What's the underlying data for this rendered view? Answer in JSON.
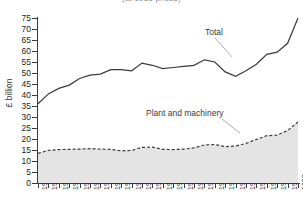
{
  "chart": {
    "title": "(at 1985 prices)",
    "y_axis_title": "£ billion",
    "total_label": "Total",
    "plant_label": "Plant and machinery"
  },
  "chart_data": {
    "type": "area",
    "title": "(at 1985 prices)",
    "xlabel": "",
    "ylabel": "£ billion",
    "ylim": [
      0,
      75
    ],
    "ytick_step": 5,
    "yticks": [
      0,
      5,
      10,
      15,
      20,
      25,
      30,
      35,
      40,
      45,
      50,
      55,
      60,
      65,
      70,
      75
    ],
    "grid": false,
    "legend": "inline-annotations",
    "categories": [
      "1963",
      "1964",
      "1965",
      "1966",
      "1967",
      "1968",
      "1969",
      "1970",
      "1971",
      "1972",
      "1973",
      "1974",
      "1975",
      "1976",
      "1977",
      "1978",
      "1979",
      "1980",
      "1981",
      "1982",
      "1983",
      "1984",
      "1985",
      "1986",
      "1987",
      "1988"
    ],
    "series": [
      {
        "name": "Total",
        "style": "solid-line",
        "color": "#3b3b3b",
        "values": [
          36.0,
          40.5,
          43.0,
          44.5,
          47.5,
          49.0,
          49.5,
          51.5,
          51.5,
          51.0,
          54.5,
          53.5,
          52.0,
          52.5,
          53.0,
          53.5,
          56.0,
          55.0,
          50.5,
          48.5,
          51.0,
          54.0,
          58.5,
          59.5,
          63.5,
          75.0
        ]
      },
      {
        "name": "Plant and machinery",
        "style": "dashed-line-with-shaded-area",
        "color": "#3b3b3b",
        "fill": "#e4e4e4",
        "values": [
          13.5,
          14.8,
          15.2,
          15.3,
          15.4,
          15.6,
          15.4,
          15.3,
          14.6,
          14.8,
          16.2,
          16.3,
          15.3,
          15.2,
          15.4,
          16.0,
          17.3,
          17.5,
          16.5,
          16.8,
          18.0,
          19.8,
          21.5,
          21.8,
          23.8,
          27.8
        ]
      }
    ]
  }
}
